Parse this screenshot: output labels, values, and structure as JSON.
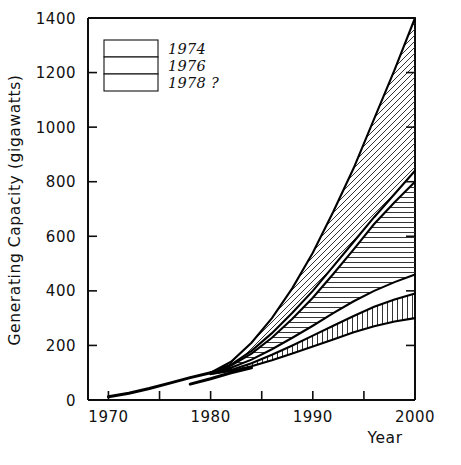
{
  "chart_data": {
    "type": "area",
    "title": "",
    "xlabel": "Year",
    "ylabel": "Generating Capacity (gigawatts)",
    "xlim": [
      1968,
      2000
    ],
    "ylim": [
      0,
      1400
    ],
    "x_ticks": [
      1970,
      1975,
      1980,
      1985,
      1990,
      1995,
      2000
    ],
    "x_tick_labels": [
      "1970",
      "",
      "1980",
      "",
      "1990",
      "",
      "2000"
    ],
    "y_ticks": [
      0,
      200,
      400,
      600,
      800,
      1000,
      1200,
      1400
    ],
    "y_tick_labels": [
      "0",
      "200",
      "400",
      "600",
      "800",
      "1000",
      "1200",
      "1400"
    ],
    "grid": false,
    "legend_position": "upper-left",
    "series": [
      {
        "name": "1974",
        "hatch": "diagonal",
        "label": "1974",
        "x": [
          1980,
          1982,
          1984,
          1986,
          1988,
          1990,
          1992,
          1994,
          1996,
          1998,
          2000
        ],
        "upper": [
          100,
          140,
          210,
          300,
          410,
          540,
          690,
          850,
          1030,
          1210,
          1400
        ],
        "lower": [
          100,
          130,
          180,
          245,
          320,
          400,
          490,
          580,
          670,
          755,
          840
        ]
      },
      {
        "name": "1976",
        "hatch": "horizontal",
        "label": "1976",
        "x": [
          1980,
          1982,
          1984,
          1986,
          1988,
          1990,
          1992,
          1994,
          1996,
          1998,
          2000
        ],
        "upper": [
          100,
          126,
          170,
          228,
          298,
          375,
          462,
          552,
          645,
          725,
          800
        ],
        "lower": [
          100,
          118,
          148,
          186,
          228,
          272,
          318,
          362,
          400,
          432,
          460
        ]
      },
      {
        "name": "1978 ?",
        "hatch": "vertical",
        "label": "1978 ?",
        "x": [
          1980,
          1982,
          1984,
          1986,
          1988,
          1990,
          1992,
          1994,
          1996,
          1998,
          2000
        ],
        "upper": [
          95,
          110,
          135,
          166,
          200,
          236,
          272,
          308,
          342,
          368,
          390
        ],
        "lower": [
          95,
          106,
          124,
          146,
          170,
          196,
          222,
          248,
          270,
          288,
          300
        ]
      }
    ],
    "historical": {
      "name": "historical",
      "x": [
        1970,
        1972,
        1974,
        1976,
        1978,
        1980,
        1982
      ],
      "y": [
        12,
        25,
        42,
        62,
        82,
        100,
        112
      ]
    },
    "historical_secondary": {
      "name": "historical-lower",
      "x": [
        1978,
        1980,
        1982,
        1984
      ],
      "y": [
        58,
        78,
        100,
        118
      ]
    },
    "annotations": []
  },
  "legend": {
    "entries": [
      {
        "label": "1974",
        "hatch": "diagonal"
      },
      {
        "label": "1976",
        "hatch": "horizontal"
      },
      {
        "label": "1978 ?",
        "hatch": "vertical"
      }
    ]
  },
  "axes": {
    "x_title": "Year",
    "y_title": "Generating Capacity  (gigawatts)"
  },
  "colors": {
    "ink": "#0d0d0d",
    "background": "#ffffff",
    "hatch": "#2a2a2a"
  }
}
